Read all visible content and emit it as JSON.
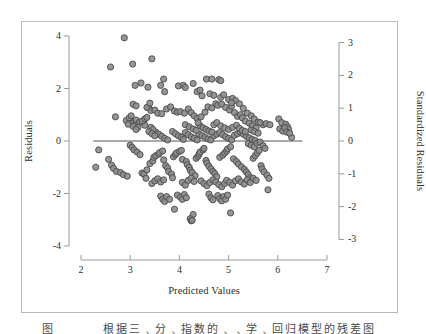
{
  "figure": {
    "caption": "图    　　 　根据三﹑分﹑指数的﹑﹑学﹑回归模型的残差图",
    "background": "#ffffff",
    "frame_color": "#b9b9b9"
  },
  "chart_data": {
    "type": "scatter",
    "title": "",
    "xlabel": "Predicted Values",
    "ylabel": "Residuals",
    "ylabel_right": "Standardized Residuals",
    "xlim": [
      2,
      7
    ],
    "ylim": [
      -4,
      4
    ],
    "ylim_right": [
      -3.2,
      3.2
    ],
    "xticks": [
      "2",
      "3",
      "4",
      "5",
      "6",
      "7"
    ],
    "xtick_values": [
      2,
      3,
      4,
      5,
      6,
      7
    ],
    "yticks": [
      "4",
      "2",
      "0",
      "-2",
      "-4"
    ],
    "ytick_values": [
      4,
      2,
      0,
      -2,
      -4
    ],
    "yticks_right": [
      "3",
      "2",
      "1",
      "0",
      "-1",
      "-2",
      "-3"
    ],
    "ytick_values_right": [
      3,
      2,
      1,
      0,
      -1,
      -2,
      -3
    ],
    "grid": false,
    "legend": "none",
    "reference_line": {
      "y": 0,
      "x_start": 2.25,
      "x_end": 6.5,
      "color": "#555555"
    },
    "marker": {
      "shape": "circle",
      "radius": 3.1,
      "fill": "#8d8d8d",
      "stroke": "#4a4a4a",
      "opacity": 0.92
    },
    "n_points": 304,
    "points": [
      [
        2.88,
        3.93
      ],
      [
        2.6,
        2.82
      ],
      [
        3.05,
        2.93
      ],
      [
        3.44,
        3.13
      ],
      [
        3.22,
        2.21
      ],
      [
        3.1,
        2.12
      ],
      [
        3.36,
        2.05
      ],
      [
        3.62,
        2.12
      ],
      [
        3.7,
        1.88
      ],
      [
        3.98,
        2.1
      ],
      [
        4.08,
        2.12
      ],
      [
        4.28,
        2.19
      ],
      [
        4.12,
        2.04
      ],
      [
        4.55,
        2.36
      ],
      [
        4.8,
        2.34
      ],
      [
        4.46,
        1.72
      ],
      [
        4.62,
        1.8
      ],
      [
        4.7,
        1.74
      ],
      [
        4.84,
        1.66
      ],
      [
        4.9,
        1.76
      ],
      [
        5.0,
        1.58
      ],
      [
        5.08,
        1.62
      ],
      [
        5.14,
        1.54
      ],
      [
        5.22,
        1.42
      ],
      [
        5.3,
        1.24
      ],
      [
        5.38,
        1.06
      ],
      [
        5.46,
        0.96
      ],
      [
        5.52,
        0.84
      ],
      [
        5.6,
        0.72
      ],
      [
        5.7,
        0.62
      ],
      [
        2.7,
        0.92
      ],
      [
        2.92,
        0.78
      ],
      [
        3.02,
        0.74
      ],
      [
        3.06,
        0.68
      ],
      [
        3.12,
        0.8
      ],
      [
        3.18,
        0.7
      ],
      [
        3.26,
        0.74
      ],
      [
        3.3,
        0.6
      ],
      [
        3.38,
        1.26
      ],
      [
        3.42,
        1.16
      ],
      [
        3.5,
        1.18
      ],
      [
        3.56,
        1.06
      ],
      [
        3.64,
        1.04
      ],
      [
        3.74,
        1.22
      ],
      [
        3.82,
        1.3
      ],
      [
        3.9,
        1.14
      ],
      [
        3.96,
        1.1
      ],
      [
        4.02,
        1.12
      ],
      [
        4.1,
        1.06
      ],
      [
        4.18,
        1.22
      ],
      [
        4.24,
        1.08
      ],
      [
        4.3,
        0.96
      ],
      [
        4.36,
        0.86
      ],
      [
        4.44,
        0.92
      ],
      [
        4.52,
        1.1
      ],
      [
        4.58,
        1.3
      ],
      [
        4.66,
        1.26
      ],
      [
        4.74,
        1.42
      ],
      [
        4.78,
        1.36
      ],
      [
        4.86,
        1.4
      ],
      [
        4.94,
        1.28
      ],
      [
        5.02,
        1.18
      ],
      [
        5.06,
        1.32
      ],
      [
        5.12,
        1.08
      ],
      [
        5.18,
        0.94
      ],
      [
        5.24,
        1.0
      ],
      [
        5.28,
        0.88
      ],
      [
        5.34,
        0.76
      ],
      [
        5.42,
        0.68
      ],
      [
        5.48,
        0.58
      ],
      [
        5.56,
        0.5
      ],
      [
        5.64,
        0.7
      ],
      [
        5.76,
        0.66
      ],
      [
        5.84,
        0.62
      ],
      [
        6.02,
        0.84
      ],
      [
        6.08,
        0.7
      ],
      [
        6.16,
        0.64
      ],
      [
        6.2,
        0.54
      ],
      [
        6.22,
        0.44
      ],
      [
        6.28,
        0.14
      ],
      [
        2.36,
        -0.34
      ],
      [
        2.3,
        -1.0
      ],
      [
        2.56,
        -0.7
      ],
      [
        2.62,
        -0.92
      ],
      [
        2.66,
        -1.04
      ],
      [
        2.72,
        -1.16
      ],
      [
        2.8,
        -1.2
      ],
      [
        2.86,
        -1.28
      ],
      [
        2.94,
        -1.34
      ],
      [
        3.0,
        -0.16
      ],
      [
        3.04,
        -0.24
      ],
      [
        3.08,
        -0.34
      ],
      [
        3.14,
        -0.42
      ],
      [
        3.2,
        -0.52
      ],
      [
        3.24,
        -1.22
      ],
      [
        3.28,
        -1.26
      ],
      [
        3.32,
        -1.42
      ],
      [
        3.34,
        -1.1
      ],
      [
        3.4,
        -0.86
      ],
      [
        3.46,
        -0.76
      ],
      [
        3.48,
        -0.62
      ],
      [
        3.52,
        -0.56
      ],
      [
        3.58,
        -0.5
      ],
      [
        3.6,
        -0.44
      ],
      [
        3.66,
        -0.38
      ],
      [
        3.68,
        -0.72
      ],
      [
        3.72,
        -0.94
      ],
      [
        3.76,
        -1.02
      ],
      [
        3.78,
        -1.16
      ],
      [
        3.84,
        -1.26
      ],
      [
        3.86,
        -1.4
      ],
      [
        3.88,
        -0.6
      ],
      [
        3.92,
        -0.52
      ],
      [
        3.94,
        -0.46
      ],
      [
        4.0,
        -0.4
      ],
      [
        4.04,
        -0.36
      ],
      [
        4.06,
        -0.7
      ],
      [
        4.14,
        -0.78
      ],
      [
        4.16,
        -0.9
      ],
      [
        4.2,
        -1.0
      ],
      [
        4.22,
        -1.12
      ],
      [
        4.26,
        -1.2
      ],
      [
        4.32,
        -1.32
      ],
      [
        4.34,
        -0.66
      ],
      [
        4.38,
        -0.58
      ],
      [
        4.4,
        -0.5
      ],
      [
        4.42,
        -0.42
      ],
      [
        4.48,
        -0.34
      ],
      [
        4.5,
        -0.28
      ],
      [
        4.54,
        -0.74
      ],
      [
        4.56,
        -0.84
      ],
      [
        4.6,
        -0.96
      ],
      [
        4.64,
        -1.06
      ],
      [
        4.68,
        -1.16
      ],
      [
        4.72,
        -1.24
      ],
      [
        4.76,
        -1.36
      ],
      [
        4.82,
        -0.62
      ],
      [
        4.88,
        -0.54
      ],
      [
        4.92,
        -0.46
      ],
      [
        4.96,
        -0.38
      ],
      [
        4.98,
        -0.3
      ],
      [
        5.04,
        -0.22
      ],
      [
        5.1,
        -0.68
      ],
      [
        5.16,
        -0.78
      ],
      [
        5.2,
        -0.88
      ],
      [
        5.26,
        -0.98
      ],
      [
        5.32,
        -1.08
      ],
      [
        5.36,
        -1.18
      ],
      [
        5.4,
        -1.28
      ],
      [
        5.44,
        -1.4
      ],
      [
        5.5,
        -0.66
      ],
      [
        5.54,
        -0.56
      ],
      [
        5.58,
        -0.46
      ],
      [
        5.62,
        -0.36
      ],
      [
        5.66,
        -0.94
      ],
      [
        5.68,
        -1.06
      ],
      [
        5.72,
        -1.18
      ],
      [
        5.78,
        -1.3
      ],
      [
        5.82,
        -1.42
      ],
      [
        5.8,
        -1.86
      ],
      [
        3.62,
        -2.1
      ],
      [
        3.66,
        -2.22
      ],
      [
        3.7,
        -2.3
      ],
      [
        3.74,
        -2.12
      ],
      [
        3.8,
        -2.22
      ],
      [
        3.96,
        -2.06
      ],
      [
        4.02,
        -2.14
      ],
      [
        4.06,
        -2.22
      ],
      [
        4.1,
        -2.04
      ],
      [
        4.14,
        -2.16
      ],
      [
        4.28,
        -2.8
      ],
      [
        4.22,
        -2.96
      ],
      [
        4.24,
        -3.04
      ],
      [
        4.26,
        -3.02
      ],
      [
        3.9,
        -2.6
      ],
      [
        4.6,
        -2.02
      ],
      [
        4.64,
        -2.16
      ],
      [
        4.68,
        -2.24
      ],
      [
        4.78,
        -2.08
      ],
      [
        4.82,
        -2.2
      ],
      [
        4.86,
        -2.28
      ],
      [
        4.9,
        -2.12
      ],
      [
        4.94,
        -2.22
      ],
      [
        4.98,
        -2.06
      ],
      [
        5.04,
        -2.74
      ],
      [
        3.24,
        0.76
      ],
      [
        3.3,
        0.84
      ],
      [
        3.34,
        0.9
      ],
      [
        3.1,
        0.6
      ],
      [
        3.16,
        0.52
      ],
      [
        4.4,
        0.26
      ],
      [
        4.46,
        0.2
      ],
      [
        4.52,
        0.14
      ],
      [
        4.58,
        0.08
      ],
      [
        4.64,
        0.04
      ],
      [
        4.7,
        0.2
      ],
      [
        4.76,
        0.26
      ],
      [
        4.82,
        0.32
      ],
      [
        4.88,
        0.24
      ],
      [
        4.94,
        0.16
      ],
      [
        5.0,
        0.1
      ],
      [
        5.06,
        0.04
      ],
      [
        5.12,
        0.22
      ],
      [
        5.18,
        0.28
      ],
      [
        5.24,
        0.34
      ],
      [
        5.3,
        0.26
      ],
      [
        5.36,
        0.18
      ],
      [
        5.42,
        0.12
      ],
      [
        5.48,
        0.06
      ],
      [
        5.54,
        0.02
      ],
      [
        4.12,
        0.32
      ],
      [
        4.18,
        0.24
      ],
      [
        4.24,
        0.16
      ],
      [
        4.3,
        0.1
      ],
      [
        4.36,
        0.04
      ],
      [
        3.86,
        0.36
      ],
      [
        3.92,
        0.28
      ],
      [
        3.98,
        0.2
      ],
      [
        4.04,
        0.14
      ],
      [
        4.08,
        0.06
      ],
      [
        3.52,
        0.34
      ],
      [
        3.58,
        0.26
      ],
      [
        3.64,
        0.18
      ],
      [
        3.7,
        0.1
      ],
      [
        3.76,
        0.04
      ],
      [
        4.7,
        0.62
      ],
      [
        4.76,
        0.7
      ],
      [
        4.84,
        0.58
      ],
      [
        4.92,
        0.5
      ],
      [
        5.0,
        0.44
      ],
      [
        5.08,
        0.52
      ],
      [
        5.16,
        0.6
      ],
      [
        5.22,
        0.48
      ],
      [
        5.28,
        0.4
      ],
      [
        5.34,
        0.36
      ],
      [
        4.42,
        0.58
      ],
      [
        4.48,
        0.5
      ],
      [
        4.54,
        0.44
      ],
      [
        4.6,
        0.38
      ],
      [
        4.66,
        0.34
      ],
      [
        4.12,
        0.62
      ],
      [
        4.2,
        0.54
      ],
      [
        4.28,
        0.46
      ],
      [
        4.34,
        0.4
      ],
      [
        4.38,
        0.7
      ],
      [
        5.4,
        -0.1
      ],
      [
        5.46,
        -0.16
      ],
      [
        5.52,
        -0.22
      ],
      [
        5.58,
        -0.08
      ],
      [
        5.64,
        -0.04
      ],
      [
        5.7,
        -0.18
      ],
      [
        5.74,
        -0.28
      ],
      [
        5.46,
        0.42
      ],
      [
        5.52,
        0.36
      ],
      [
        5.6,
        0.3
      ],
      [
        6.04,
        0.46
      ],
      [
        6.1,
        0.38
      ],
      [
        6.14,
        0.5
      ],
      [
        6.18,
        0.34
      ],
      [
        6.24,
        0.3
      ],
      [
        2.98,
        0.88
      ],
      [
        3.02,
        0.96
      ],
      [
        2.96,
        0.64
      ],
      [
        3.06,
        0.56
      ],
      [
        3.12,
        0.44
      ],
      [
        3.42,
        0.52
      ],
      [
        3.46,
        0.44
      ],
      [
        3.38,
        0.36
      ],
      [
        3.44,
        0.28
      ],
      [
        3.5,
        0.2
      ],
      [
        4.44,
        -1.52
      ],
      [
        4.5,
        -1.62
      ],
      [
        4.56,
        -1.7
      ],
      [
        4.62,
        -1.58
      ],
      [
        4.68,
        -1.48
      ],
      [
        4.74,
        -1.56
      ],
      [
        4.8,
        -1.66
      ],
      [
        4.86,
        -1.74
      ],
      [
        4.92,
        -1.62
      ],
      [
        4.96,
        -1.5
      ],
      [
        5.02,
        -1.58
      ],
      [
        5.08,
        -1.68
      ],
      [
        5.14,
        -1.52
      ],
      [
        5.2,
        -1.44
      ],
      [
        5.26,
        -1.56
      ],
      [
        5.32,
        -1.64
      ],
      [
        5.38,
        -1.48
      ],
      [
        5.44,
        -1.58
      ],
      [
        5.5,
        -1.42
      ],
      [
        5.56,
        -1.5
      ],
      [
        4.06,
        -1.58
      ],
      [
        4.12,
        -1.68
      ],
      [
        4.18,
        -1.5
      ],
      [
        4.24,
        -1.42
      ],
      [
        4.3,
        -1.54
      ],
      [
        3.44,
        -1.62
      ],
      [
        3.5,
        -1.52
      ],
      [
        3.56,
        -1.44
      ],
      [
        3.62,
        -1.56
      ],
      [
        3.68,
        -1.48
      ],
      [
        4.66,
        2.36
      ],
      [
        4.84,
        2.3
      ],
      [
        3.68,
        2.36
      ],
      [
        4.36,
        1.88
      ],
      [
        4.42,
        1.94
      ],
      [
        3.06,
        1.4
      ],
      [
        3.12,
        1.34
      ],
      [
        3.34,
        1.28
      ],
      [
        3.4,
        1.44
      ],
      [
        5.06,
        1.46
      ]
    ]
  }
}
